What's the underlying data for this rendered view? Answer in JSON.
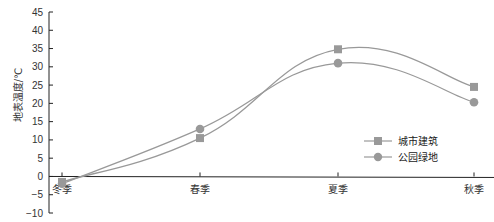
{
  "chart_data": {
    "type": "line",
    "title": "",
    "xlabel": "",
    "ylabel": "地表温度/℃",
    "categories": [
      "冬季",
      "春季",
      "夏季",
      "秋季"
    ],
    "series": [
      {
        "name": "城市建筑",
        "marker": "square",
        "color": "#999999",
        "values": [
          -1.5,
          10.5,
          34.8,
          24.5
        ]
      },
      {
        "name": "公园绿地",
        "marker": "circle",
        "color": "#999999",
        "values": [
          -2.0,
          13.0,
          31.0,
          20.3
        ]
      }
    ],
    "ylim": [
      -10,
      45
    ],
    "yticks": [
      45,
      40,
      35,
      30,
      25,
      20,
      15,
      10,
      5,
      0,
      -5,
      -10
    ],
    "ytick_labels": [
      "45",
      "40",
      "35",
      "30",
      "25",
      "20",
      "15",
      "10",
      "5",
      "0",
      "−5",
      "−10"
    ],
    "grid": false,
    "smooth": true,
    "legend_position": "lower-right-inside"
  },
  "legend": {
    "items": [
      {
        "label": "城市建筑",
        "marker": "square"
      },
      {
        "label": "公园绿地",
        "marker": "circle"
      }
    ]
  },
  "axis": {
    "ylabel": "地表温度/℃"
  }
}
